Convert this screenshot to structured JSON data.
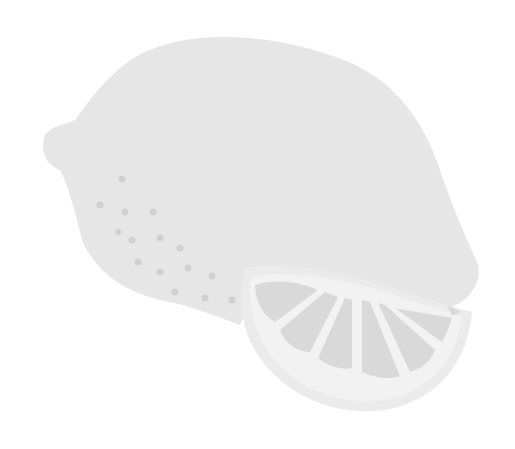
{
  "image": {
    "subject": "lemon-with-slice",
    "style": "grayscale flat illustration",
    "colors": {
      "background": "#ffffff",
      "lemon_body": "#e6e6e6",
      "lemon_dots": "#d0d0d0",
      "slice_rind": "#ebebeb",
      "slice_pith": "#f2f2f2",
      "slice_segments": "#d9d9d9"
    },
    "dot_count": 15,
    "segment_count": 7
  }
}
